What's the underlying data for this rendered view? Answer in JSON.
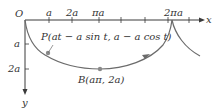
{
  "diagram": {
    "type": "cycloid",
    "colors": {
      "axis": "#3a3a3a",
      "curve": "#6b6b6b",
      "point": "#8a8a8a",
      "text": "#333333"
    },
    "origin_label": "O",
    "x_axis": {
      "label": "x",
      "ticks": [
        "a",
        "2a",
        "πa",
        "2πa"
      ]
    },
    "y_axis": {
      "label": "y",
      "ticks": [
        "a",
        "2a"
      ]
    },
    "points": [
      {
        "name": "P",
        "label": "P(at − a sin t, a − a cos t)"
      },
      {
        "name": "B",
        "label": "B(aπ, 2a)"
      }
    ]
  }
}
